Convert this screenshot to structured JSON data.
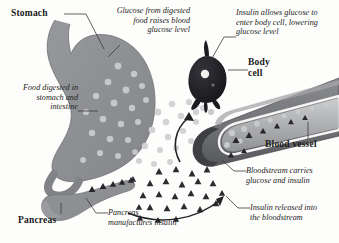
{
  "diagram": {
    "background_color": "#fdfdfc",
    "organ_fill": "#8f9093",
    "organ_fill_light": "#a9aaad",
    "glucose_color": "#c9cacb",
    "insulin_color": "#2f2f33",
    "cell_color": "#1d1d20",
    "vessel_color": "#6e6f73",
    "leader_color": "#3a3a3a"
  },
  "labels": {
    "stomach": "Stomach",
    "body_cell_line1": "Body",
    "body_cell_line2": "cell",
    "blood_vessel": "Blood vessel",
    "pancreas": "Pancreas"
  },
  "annotations": {
    "glucose_raises": "Glucose from digested\nfood raises blood\nglucose level",
    "glucose_raises_lines": [
      "Glucose from digested",
      "food raises blood",
      "glucose level"
    ],
    "food_digested_lines": [
      "Food digested in",
      "stomach and",
      "intestine"
    ],
    "insulin_allows_lines": [
      "Insulin allows glucose to",
      "enter body cell, lowering",
      "glucose level"
    ],
    "bloodstream_carries_lines": [
      "Bloodstream carries",
      "glucose and insulin"
    ],
    "insulin_released_lines": [
      "Insulin released into",
      "the bloodstream"
    ],
    "pancreas_manufactures_lines": [
      "Pancreas",
      "manufactures insulin"
    ]
  },
  "legend_symbols": {
    "glucose": "light-gray-circle",
    "insulin": "dark-triangle"
  }
}
